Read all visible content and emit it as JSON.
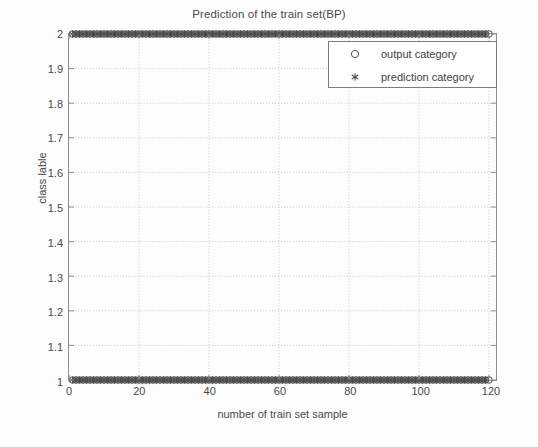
{
  "chart_data": {
    "type": "scatter",
    "title": "Prediction of the train set(BP)",
    "xlabel": "number of train set sample",
    "ylabel": "class lable",
    "xlim": [
      0,
      122
    ],
    "ylim": [
      1,
      2
    ],
    "xticks": [
      0,
      20,
      40,
      60,
      80,
      100,
      120
    ],
    "xtick_labels": [
      "0",
      "20",
      "40",
      "60",
      "80",
      "100",
      "120"
    ],
    "yticks": [
      1,
      1.1,
      1.2,
      1.3,
      1.4,
      1.5,
      1.6,
      1.7,
      1.8,
      1.9,
      2
    ],
    "ytick_labels": [
      "1",
      "1.1",
      "1.2",
      "1.3",
      "1.4",
      "1.5",
      "1.6",
      "1.7",
      "1.8",
      "1.9",
      "2"
    ],
    "grid": true,
    "grid_style": "dotted",
    "legend_position": "top-right",
    "marker_color": "#4a4a4a",
    "grid_color": "#c8c8c8",
    "axis_color": "#8d8d8d",
    "series": [
      {
        "name": "output category",
        "marker": "circle",
        "x": [
          1,
          2,
          3,
          4,
          5,
          6,
          7,
          8,
          9,
          10,
          11,
          12,
          13,
          14,
          15,
          16,
          17,
          18,
          19,
          20,
          21,
          22,
          23,
          24,
          25,
          26,
          27,
          28,
          29,
          30,
          31,
          32,
          33,
          34,
          35,
          36,
          37,
          38,
          39,
          40,
          41,
          42,
          43,
          44,
          45,
          46,
          47,
          48,
          49,
          50,
          51,
          52,
          53,
          54,
          55,
          56,
          57,
          58,
          59,
          60,
          61,
          62,
          63,
          64,
          65,
          66,
          67,
          68,
          69,
          70,
          71,
          72,
          73,
          74,
          75,
          76,
          77,
          78,
          79,
          80,
          81,
          82,
          83,
          84,
          85,
          86,
          87,
          88,
          89,
          90,
          91,
          92,
          93,
          94,
          95,
          96,
          97,
          98,
          99,
          100,
          101,
          102,
          103,
          104,
          105,
          106,
          107,
          108,
          109,
          110,
          111,
          112,
          113,
          114,
          115,
          116,
          117,
          118,
          119,
          120
        ],
        "y": [
          2,
          2,
          2,
          2,
          2,
          2,
          2,
          2,
          2,
          2,
          2,
          2,
          2,
          2,
          2,
          2,
          2,
          2,
          2,
          2,
          2,
          2,
          2,
          2,
          2,
          2,
          2,
          2,
          2,
          2,
          2,
          2,
          2,
          2,
          2,
          2,
          2,
          2,
          2,
          2,
          2,
          2,
          2,
          2,
          2,
          2,
          2,
          2,
          2,
          2,
          2,
          2,
          2,
          2,
          2,
          2,
          2,
          2,
          2,
          2,
          2,
          2,
          2,
          2,
          2,
          2,
          2,
          2,
          2,
          2,
          2,
          2,
          2,
          2,
          2,
          2,
          2,
          2,
          2,
          2,
          2,
          2,
          2,
          2,
          2,
          2,
          2,
          2,
          2,
          2,
          2,
          2,
          2,
          2,
          2,
          2,
          2,
          2,
          2,
          2,
          2,
          2,
          2,
          2,
          2,
          2,
          2,
          2,
          2,
          2,
          2,
          2,
          2,
          2,
          2,
          2,
          2,
          2,
          2,
          2
        ]
      },
      {
        "name": "prediction category",
        "marker": "asterisk",
        "x": [
          1,
          2,
          3,
          4,
          5,
          6,
          7,
          8,
          9,
          10,
          11,
          12,
          13,
          14,
          15,
          16,
          17,
          18,
          19,
          20,
          21,
          22,
          23,
          24,
          25,
          26,
          27,
          28,
          29,
          30,
          31,
          32,
          33,
          34,
          35,
          36,
          37,
          38,
          39,
          40,
          41,
          42,
          43,
          44,
          45,
          46,
          47,
          48,
          49,
          50,
          51,
          52,
          53,
          54,
          55,
          56,
          57,
          58,
          59,
          60,
          61,
          62,
          63,
          64,
          65,
          66,
          67,
          68,
          69,
          70,
          71,
          72,
          73,
          74,
          75,
          76,
          77,
          78,
          79,
          80,
          81,
          82,
          83,
          84,
          85,
          86,
          87,
          88,
          89,
          90,
          91,
          92,
          93,
          94,
          95,
          96,
          97,
          98,
          99,
          100,
          101,
          102,
          103,
          104,
          105,
          106,
          107,
          108,
          109,
          110,
          111,
          112,
          113,
          114,
          115,
          116,
          117,
          118,
          119
        ],
        "y": [
          2,
          2,
          2,
          2,
          2,
          2,
          2,
          2,
          2,
          2,
          2,
          2,
          2,
          2,
          2,
          2,
          2,
          2,
          2,
          2,
          2,
          2,
          2,
          2,
          2,
          2,
          2,
          2,
          2,
          2,
          2,
          2,
          2,
          2,
          2,
          2,
          2,
          2,
          2,
          2,
          2,
          2,
          2,
          2,
          2,
          2,
          2,
          2,
          2,
          2,
          2,
          2,
          2,
          2,
          2,
          2,
          2,
          2,
          2,
          2,
          2,
          2,
          2,
          2,
          2,
          2,
          2,
          2,
          2,
          2,
          2,
          2,
          2,
          2,
          2,
          2,
          2,
          2,
          2,
          2,
          2,
          2,
          2,
          2,
          2,
          2,
          2,
          2,
          2,
          2,
          2,
          2,
          2,
          2,
          2,
          2,
          2,
          2,
          2,
          2,
          2,
          2,
          2,
          2,
          2,
          2,
          2,
          2,
          2,
          2,
          2,
          2,
          2,
          2,
          2,
          2,
          2,
          2,
          2
        ]
      }
    ],
    "lower_row": {
      "note": "dense cluster of both series at class label 1 across the full sample range",
      "y": 1,
      "x_start": 1,
      "x_end": 120,
      "count": 120
    }
  },
  "legend": {
    "entries": [
      {
        "label": "output category",
        "marker": "circle"
      },
      {
        "label": "prediction category",
        "marker": "asterisk"
      }
    ]
  }
}
